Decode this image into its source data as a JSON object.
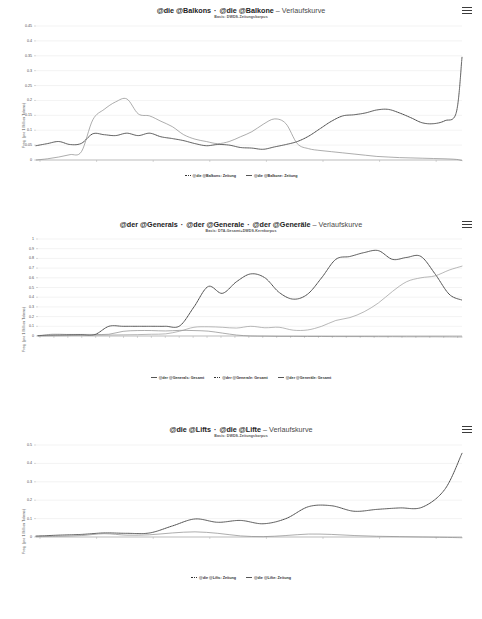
{
  "page": {
    "background": "#ffffff",
    "width": 482,
    "height": 619
  },
  "icons": {
    "menu": "hamburger-menu-icon"
  },
  "charts": [
    {
      "id": "chart1",
      "title_part1": "@die @Balkons",
      "title_sep": "·",
      "title_part2": "@die @Balkone",
      "title_dash": "–",
      "title_suffix": "Verlaufskurve",
      "subtitle": "Basis: DWDS-Zeitungskorpus",
      "ylabel": "Freq. (pro 1 Million Tokens)",
      "yticks": [
        "0",
        "0.05",
        "0.1",
        "0.15",
        "0.2",
        "0.25",
        "0.3",
        "0.35",
        "0.4",
        "0.45"
      ],
      "xticks": [
        "1946",
        "1956",
        "1966",
        "1976",
        "1986",
        "1996",
        "2006",
        "2016"
      ],
      "legend": [
        "@die @Balkons: Zeitung",
        "@die @Balkone: Zeitung"
      ],
      "chart_data": {
        "type": "line",
        "title": "@die @Balkons · @die @Balkone – Verlaufskurve",
        "subtitle": "Basis: DWDS-Zeitungskorpus",
        "xlabel": "",
        "ylabel": "Freq. (pro 1 Million Tokens)",
        "xlim": [
          1946,
          2021
        ],
        "ylim": [
          0,
          0.45
        ],
        "grid": true,
        "legend_position": "bottom",
        "x": [
          1946,
          1948,
          1950,
          1952,
          1954,
          1956,
          1958,
          1960,
          1962,
          1964,
          1966,
          1968,
          1970,
          1972,
          1974,
          1976,
          1978,
          1980,
          1982,
          1984,
          1986,
          1988,
          1990,
          1992,
          1994,
          1996,
          1998,
          2000,
          2002,
          2004,
          2006,
          2008,
          2010,
          2012,
          2014,
          2016,
          2018,
          2020,
          2021
        ],
        "series": [
          {
            "name": "@die @Balkons: Zeitung",
            "style": "dotted",
            "values": [
              0.048,
              0.055,
              0.062,
              0.052,
              0.056,
              0.088,
              0.085,
              0.082,
              0.09,
              0.082,
              0.09,
              0.078,
              0.072,
              0.065,
              0.055,
              0.048,
              0.052,
              0.05,
              0.042,
              0.04,
              0.036,
              0.044,
              0.052,
              0.062,
              0.08,
              0.105,
              0.13,
              0.148,
              0.152,
              0.158,
              0.168,
              0.17,
              0.158,
              0.142,
              0.125,
              0.122,
              0.132,
              0.16,
              0.345
            ]
          },
          {
            "name": "@die @Balkone: Zeitung",
            "style": "solid",
            "values": [
              0.0,
              0.004,
              0.01,
              0.018,
              0.028,
              0.135,
              0.17,
              0.195,
              0.205,
              0.155,
              0.148,
              0.13,
              0.112,
              0.085,
              0.07,
              0.062,
              0.055,
              0.062,
              0.078,
              0.095,
              0.12,
              0.138,
              0.122,
              0.055,
              0.038,
              0.032,
              0.028,
              0.024,
              0.02,
              0.016,
              0.012,
              0.01,
              0.008,
              0.007,
              0.006,
              0.005,
              0.004,
              0.002,
              -0.002
            ]
          }
        ]
      }
    },
    {
      "id": "chart2",
      "title_part1": "@der @Generals",
      "title_sep": "·",
      "title_part2": "@der @Generale",
      "title_sep2": "·",
      "title_part3": "@der @Generäle",
      "title_dash": "–",
      "title_suffix": "Verlaufskurve",
      "subtitle": "Basis: DTA-Gesamt+DWDS-Kernkorpus",
      "ylabel": "Freq. (pro 1 Million Tokens)",
      "yticks": [
        "0",
        "0.1",
        "0.2",
        "0.3",
        "0.4",
        "0.5",
        "0.6",
        "0.7",
        "0.8",
        "0.9",
        "1"
      ],
      "xticks": [
        "1700",
        "1715",
        "1720",
        "1730",
        "1740",
        "1750",
        "1760",
        "1775",
        "1785",
        "1795",
        "1800",
        "1810",
        "1820",
        "1830",
        "1840",
        "1850",
        "1855",
        "1865",
        "1875",
        "1880",
        "1890",
        "1900",
        "1912",
        "1920",
        "1930",
        "1945",
        "1955",
        "1960",
        "1970",
        "1980",
        "1990"
      ],
      "legend": [
        "@der @Generals: Gesamt",
        "@der @Generale: Gesamt",
        "@der @Generäle: Gesamt"
      ],
      "chart_data": {
        "type": "line",
        "title": "@der @Generals · @der @Generale · @der @Generäle – Verlaufskurve",
        "subtitle": "Basis: DTA-Gesamt+DWDS-Kernkorpus",
        "xlabel": "",
        "ylabel": "Freq. (pro 1 Million Tokens)",
        "xlim": [
          1700,
          1999
        ],
        "ylim": [
          0,
          1
        ],
        "grid": true,
        "legend_position": "bottom",
        "x": [
          1700,
          1710,
          1720,
          1730,
          1740,
          1750,
          1760,
          1770,
          1780,
          1790,
          1800,
          1810,
          1820,
          1830,
          1840,
          1850,
          1860,
          1870,
          1880,
          1890,
          1900,
          1910,
          1920,
          1930,
          1940,
          1950,
          1960,
          1970,
          1980,
          1990,
          1999
        ],
        "series": [
          {
            "name": "@der @Generals: Gesamt",
            "style": "solid",
            "values": [
              0.0,
              0.018,
              0.016,
              0.016,
              0.016,
              0.018,
              0.048,
              0.056,
              0.056,
              0.052,
              0.058,
              0.056,
              0.05,
              0.03,
              0.01,
              0.0,
              -0.002,
              -0.004,
              -0.004,
              -0.005,
              -0.005,
              -0.006,
              -0.006,
              -0.006,
              -0.007,
              -0.007,
              -0.008,
              -0.008,
              -0.008,
              -0.009,
              -0.01
            ]
          },
          {
            "name": "@der @Generale: Gesamt",
            "style": "dotted",
            "values": [
              0.005,
              0.008,
              0.01,
              0.012,
              0.014,
              0.1,
              0.1,
              0.1,
              0.1,
              0.1,
              0.105,
              0.3,
              0.51,
              0.44,
              0.56,
              0.64,
              0.6,
              0.45,
              0.38,
              0.43,
              0.6,
              0.79,
              0.82,
              0.86,
              0.88,
              0.79,
              0.81,
              0.82,
              0.64,
              0.43,
              0.37
            ]
          },
          {
            "name": "@der @Generäle: Gesamt",
            "style": "solid-light",
            "values": [
              0.0,
              0.002,
              0.004,
              0.006,
              0.008,
              0.01,
              0.012,
              0.014,
              0.018,
              0.022,
              0.05,
              0.09,
              0.095,
              0.09,
              0.082,
              0.1,
              0.085,
              0.09,
              0.06,
              0.062,
              0.1,
              0.16,
              0.19,
              0.25,
              0.34,
              0.46,
              0.56,
              0.6,
              0.62,
              0.68,
              0.72
            ]
          }
        ]
      }
    },
    {
      "id": "chart3",
      "title_part1": "@die @Lifts",
      "title_sep": "·",
      "title_part2": "@die @Lifte",
      "title_dash": "–",
      "title_suffix": "Verlaufskurve",
      "subtitle": "Basis: DWDS-Zeitungskorpus",
      "ylabel": "Freq. (pro 1 Million Tokens)",
      "yticks": [
        "0",
        "0.1",
        "0.2",
        "0.3",
        "0.4",
        "0.5"
      ],
      "xticks": [
        "1946",
        "1956",
        "1966",
        "1976",
        "1986",
        "1996",
        "2006",
        "2016"
      ],
      "legend": [
        "@die @Lifts: Zeitung",
        "@die @Lifte: Zeitung"
      ],
      "chart_data": {
        "type": "line",
        "title": "@die @Lifts · @die @Lifte – Verlaufskurve",
        "subtitle": "Basis: DWDS-Zeitungskorpus",
        "xlabel": "",
        "ylabel": "Freq. (pro 1 Million Tokens)",
        "xlim": [
          1946,
          2021
        ],
        "ylim": [
          0,
          0.5
        ],
        "grid": true,
        "legend_position": "bottom",
        "x": [
          1946,
          1950,
          1954,
          1958,
          1962,
          1966,
          1970,
          1974,
          1978,
          1982,
          1986,
          1990,
          1994,
          1998,
          2002,
          2006,
          2010,
          2014,
          2018,
          2021
        ],
        "series": [
          {
            "name": "@die @Lifts: Zeitung",
            "style": "dotted",
            "values": [
              0.005,
              0.01,
              0.014,
              0.022,
              0.02,
              0.022,
              0.06,
              0.098,
              0.08,
              0.09,
              0.072,
              0.1,
              0.165,
              0.17,
              0.14,
              0.15,
              0.158,
              0.162,
              0.26,
              0.455
            ]
          },
          {
            "name": "@die @Lifte: Zeitung",
            "style": "solid",
            "values": [
              0.002,
              0.004,
              0.008,
              0.018,
              0.01,
              0.012,
              0.022,
              0.028,
              0.02,
              0.006,
              0.002,
              0.008,
              0.016,
              0.014,
              0.008,
              0.004,
              0.002,
              0.0,
              -0.002,
              -0.004
            ]
          }
        ]
      }
    }
  ]
}
